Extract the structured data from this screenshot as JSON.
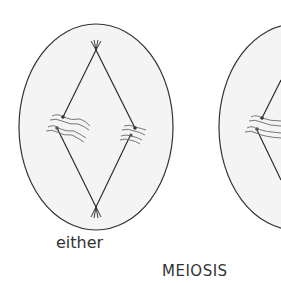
{
  "labels": {
    "either": "either",
    "meiosis": "MEIOSIS"
  },
  "colors": {
    "cell_fill": "#f3f3f3",
    "cell_outline": "#333333",
    "spindle": "#222222",
    "chromosome": "#666666",
    "text": "#333333"
  },
  "cells": [
    {
      "name": "left-cell",
      "complete": true
    },
    {
      "name": "right-cell",
      "complete": false
    }
  ]
}
